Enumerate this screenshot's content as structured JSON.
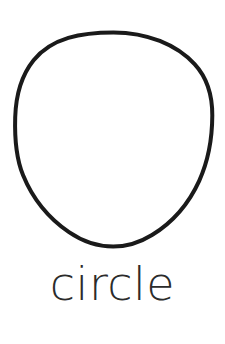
{
  "card": {
    "background_color": "#ffffff",
    "width": 225,
    "height": 344
  },
  "shape": {
    "name": "circle",
    "icon_name": "circle-outline-icon",
    "style": "hand-drawn outline",
    "stroke_color": "#1a1a1a",
    "fill_color": "none",
    "stroke_width": 4,
    "center_x": 113,
    "center_y": 141,
    "radius_x": 98,
    "radius_y": 109,
    "bounds": {
      "left": 15,
      "top": 32,
      "right": 212,
      "bottom": 250
    }
  },
  "label": {
    "text": "circle",
    "color": "#2b2b2b",
    "font_size": 46,
    "baseline_y": 305
  }
}
